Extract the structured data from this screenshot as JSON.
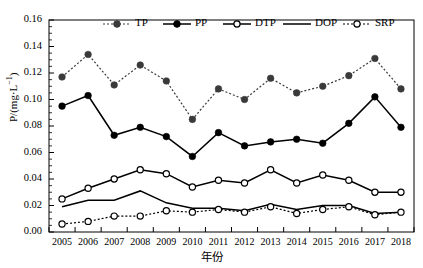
{
  "chart_data": {
    "type": "line",
    "title": "",
    "xlabel": "年份",
    "ylabel": "P/(mg·L⁻¹)",
    "categories": [
      "2005",
      "2006",
      "2007",
      "2008",
      "2009",
      "2010",
      "2011",
      "2012",
      "2013",
      "2014",
      "2015",
      "2016",
      "2017",
      "2018"
    ],
    "xlim": [
      2004.5,
      2018.5
    ],
    "ylim": [
      0.0,
      0.16
    ],
    "yticks": [
      "0.00",
      "0.02",
      "0.04",
      "0.06",
      "0.08",
      "0.10",
      "0.12",
      "0.14",
      "0.16"
    ],
    "ytick_values": [
      0.0,
      0.02,
      0.04,
      0.06,
      0.08,
      0.1,
      0.12,
      0.14,
      0.16
    ],
    "grid": false,
    "legend_position": "top-center",
    "series": [
      {
        "name": "TP",
        "line_style": "dotted",
        "marker": "filled-circle",
        "color": "#3a3a3a",
        "values": [
          0.117,
          0.134,
          0.111,
          0.126,
          0.114,
          0.085,
          0.108,
          0.1,
          0.116,
          0.105,
          0.11,
          0.118,
          0.131,
          0.108
        ]
      },
      {
        "name": "PP",
        "line_style": "solid",
        "marker": "filled-circle",
        "color": "#000000",
        "values": [
          0.095,
          0.103,
          0.073,
          0.079,
          0.072,
          0.057,
          0.075,
          0.065,
          0.068,
          0.07,
          0.067,
          0.082,
          0.102,
          0.079
        ]
      },
      {
        "name": "DTP",
        "line_style": "solid",
        "marker": "open-circle",
        "color": "#000000",
        "values": [
          0.025,
          0.033,
          0.04,
          0.047,
          0.044,
          0.034,
          0.039,
          0.037,
          0.047,
          0.037,
          0.043,
          0.039,
          0.03,
          0.03
        ]
      },
      {
        "name": "DOP",
        "line_style": "solid",
        "marker": "none",
        "color": "#000000",
        "values": [
          0.019,
          0.024,
          0.024,
          0.031,
          0.022,
          0.018,
          0.018,
          0.016,
          0.021,
          0.017,
          0.02,
          0.02,
          0.014,
          0.015
        ]
      },
      {
        "name": "SRP",
        "line_style": "dotted",
        "marker": "open-circle",
        "color": "#000000",
        "values": [
          0.006,
          0.008,
          0.012,
          0.012,
          0.016,
          0.015,
          0.017,
          0.015,
          0.019,
          0.014,
          0.017,
          0.019,
          0.013,
          0.015
        ]
      }
    ]
  },
  "legend": {
    "items": [
      {
        "label": "TP"
      },
      {
        "label": "PP"
      },
      {
        "label": "DTP"
      },
      {
        "label": "DOP"
      },
      {
        "label": "SRP"
      }
    ]
  },
  "axes": {
    "y_title": "P/(mg·L⁻¹)",
    "x_title": "年份"
  }
}
